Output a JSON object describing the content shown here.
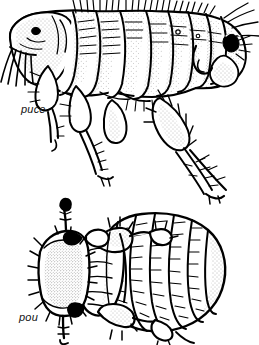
{
  "document": {
    "kind": "scientific-line-illustration",
    "background_color": "#ffffff",
    "ink_color": "#000000",
    "width": 259,
    "height": 345
  },
  "figures": [
    {
      "id": "flea",
      "caption": "puce",
      "icon_name": "flea-illustration",
      "view": "lateral",
      "orientation": "head-left",
      "description_visible_parts": [
        "head with eye spot",
        "mouthparts",
        "thorax segments",
        "segmented abdomen",
        "three pairs of bristled legs",
        "sensilium at rear"
      ]
    },
    {
      "id": "louse",
      "caption": "pou",
      "icon_name": "louse-illustration",
      "view": "dorsal",
      "orientation": "head-left",
      "description_visible_parts": [
        "head with antennae",
        "thorax",
        "banded segmented abdomen",
        "three pairs of clawed legs"
      ]
    }
  ]
}
